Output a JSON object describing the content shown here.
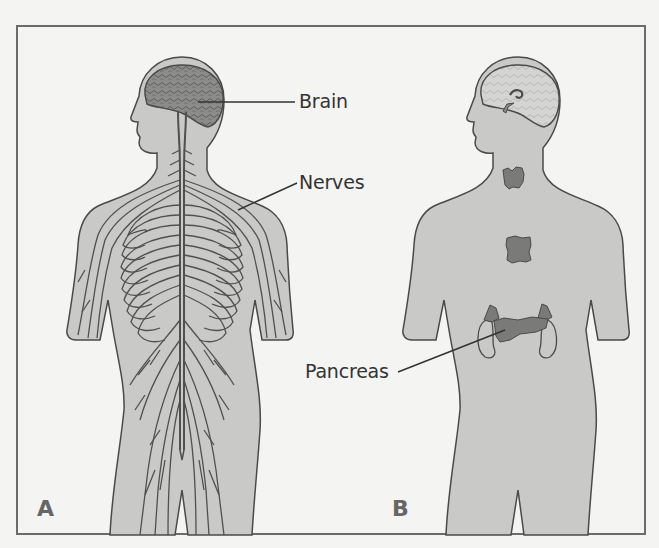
{
  "figure": {
    "panels": [
      {
        "id": "A",
        "letter": "A",
        "title": "Nervous system",
        "labels": [
          "Brain",
          "Nerves"
        ]
      },
      {
        "id": "B",
        "letter": "B",
        "title": "Endocrine system",
        "labels": [
          "Pancreas"
        ]
      }
    ],
    "labels": {
      "brain": "Brain",
      "nerves": "Nerves",
      "pancreas": "Pancreas"
    },
    "panel_letters": {
      "a": "A",
      "b": "B"
    },
    "colors": {
      "background": "#f4f4f2",
      "body_fill": "#c9c9c7",
      "outline": "#4a4a4a",
      "nerve": "#505050",
      "brain": "#8a8a88",
      "gland": "#7a7a78",
      "frame": "#6b6b6b",
      "text": "#333333"
    }
  }
}
